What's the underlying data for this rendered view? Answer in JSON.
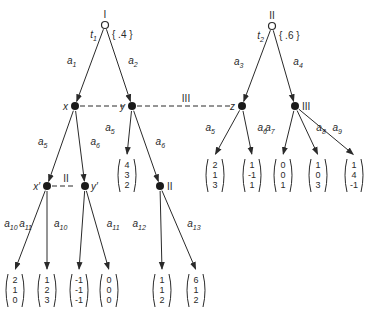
{
  "diagram": {
    "type": "extensive-form game tree",
    "roots": [
      {
        "id": "r1",
        "player_label": "I",
        "type_label": "t",
        "type_sub": "1",
        "prob": "{ .4 }",
        "x": 105,
        "y": 25
      },
      {
        "id": "r2",
        "player_label": "II",
        "type_label": "t",
        "type_sub": "2",
        "prob": "{ .6 }",
        "x": 272,
        "y": 26
      }
    ],
    "decision_nodes": [
      {
        "id": "x",
        "label": "x",
        "x": 75,
        "y": 106
      },
      {
        "id": "y",
        "label": "y",
        "x": 132,
        "y": 106
      },
      {
        "id": "z",
        "label": "z",
        "x": 242,
        "y": 106
      },
      {
        "id": "n3",
        "label": "III",
        "x": 295,
        "y": 106
      },
      {
        "id": "xp",
        "label": "x′",
        "x": 47,
        "y": 186
      },
      {
        "id": "yp",
        "label": "y′",
        "x": 85,
        "y": 186
      },
      {
        "id": "n2",
        "label": "II",
        "x": 160,
        "y": 186
      }
    ],
    "information_sets": [
      {
        "player": "III",
        "nodes": [
          "x",
          "y",
          "z"
        ],
        "label": "III"
      },
      {
        "player": "II",
        "nodes": [
          "xp",
          "yp"
        ],
        "label": "II"
      }
    ],
    "edges": [
      {
        "from": "r1",
        "to": "x",
        "action": "a",
        "sub": "1"
      },
      {
        "from": "r1",
        "to": "y",
        "action": "a",
        "sub": "2"
      },
      {
        "from": "r2",
        "to": "z",
        "action": "a",
        "sub": "3"
      },
      {
        "from": "r2",
        "to": "n3",
        "action": "a",
        "sub": "4"
      },
      {
        "from": "x",
        "to": "xp",
        "action": "a",
        "sub": "5"
      },
      {
        "from": "x",
        "to": "yp",
        "action": "a",
        "sub": "6"
      },
      {
        "from": "y",
        "to": "p1",
        "action": "a",
        "sub": "5"
      },
      {
        "from": "y",
        "to": "n2",
        "action": "a",
        "sub": "6"
      },
      {
        "from": "z",
        "to": "p2",
        "action": "a",
        "sub": "5"
      },
      {
        "from": "z",
        "to": "p3",
        "action": "a",
        "sub": "6"
      },
      {
        "from": "n3",
        "to": "p4",
        "action": "a",
        "sub": "7"
      },
      {
        "from": "n3",
        "to": "p5",
        "action": "a",
        "sub": "8"
      },
      {
        "from": "n3",
        "to": "p6",
        "action": "a",
        "sub": "9"
      },
      {
        "from": "xp",
        "to": "p7",
        "action": "a",
        "sub": "10"
      },
      {
        "from": "xp",
        "to": "p8",
        "action": "a",
        "sub": "11"
      },
      {
        "from": "yp",
        "to": "p9",
        "action": "a",
        "sub": "10"
      },
      {
        "from": "yp",
        "to": "p10",
        "action": "a",
        "sub": "11"
      },
      {
        "from": "n2",
        "to": "p11",
        "action": "a",
        "sub": "12"
      },
      {
        "from": "n2",
        "to": "p12",
        "action": "a",
        "sub": "13"
      }
    ],
    "payoffs": [
      {
        "id": "p1",
        "values": [
          "4",
          "3",
          "2"
        ],
        "x": 127,
        "y": 175
      },
      {
        "id": "p2",
        "values": [
          "2",
          "1",
          "3"
        ],
        "x": 215,
        "y": 175
      },
      {
        "id": "p3",
        "values": [
          "1",
          "-1",
          "1"
        ],
        "x": 252,
        "y": 175
      },
      {
        "id": "p4",
        "values": [
          "0",
          "0",
          "1"
        ],
        "x": 283,
        "y": 175
      },
      {
        "id": "p5",
        "values": [
          "1",
          "0",
          "3"
        ],
        "x": 318,
        "y": 175
      },
      {
        "id": "p6",
        "values": [
          "1",
          "4",
          "-1"
        ],
        "x": 354,
        "y": 175
      },
      {
        "id": "p7",
        "values": [
          "2",
          "1",
          "0"
        ],
        "x": 15,
        "y": 290
      },
      {
        "id": "p8",
        "values": [
          "1",
          "2",
          "3"
        ],
        "x": 47,
        "y": 290
      },
      {
        "id": "p9",
        "values": [
          "-1",
          "-1",
          "-1"
        ],
        "x": 79,
        "y": 290
      },
      {
        "id": "p10",
        "values": [
          "0",
          "0",
          "0"
        ],
        "x": 109,
        "y": 290
      },
      {
        "id": "p11",
        "values": [
          "1",
          "1",
          "2"
        ],
        "x": 162,
        "y": 290
      },
      {
        "id": "p12",
        "values": [
          "6",
          "1",
          "2"
        ],
        "x": 196,
        "y": 290
      }
    ]
  }
}
